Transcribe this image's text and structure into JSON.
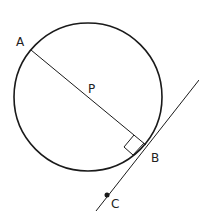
{
  "diagram": {
    "labels": {
      "A": "A",
      "P": "P",
      "B": "B",
      "C": "C"
    },
    "colors": {
      "stroke": "#1a1a1a",
      "background": "#ffffff"
    },
    "elements": {
      "circle": {
        "cx": 88,
        "cy": 97,
        "r": 74
      },
      "diameter": {
        "from": "A",
        "to": "B"
      },
      "tangent": {
        "through": [
          "B",
          "C"
        ]
      },
      "right_angle_at": "B"
    }
  }
}
